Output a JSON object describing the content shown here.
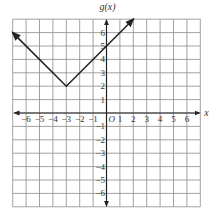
{
  "chart_data": {
    "type": "line",
    "title": "",
    "function_label": "g(x)",
    "xlabel": "x",
    "ylabel": "g(x)",
    "xlim": [
      -7,
      7
    ],
    "ylim": [
      -7,
      7
    ],
    "grid": true,
    "x_ticks": [
      -6,
      -5,
      -4,
      -3,
      -2,
      -1,
      1,
      2,
      3,
      4,
      5,
      6
    ],
    "y_ticks": [
      -6,
      -5,
      -4,
      -3,
      -2,
      -1,
      1,
      2,
      3,
      4,
      5,
      6
    ],
    "origin_label": "O",
    "series": [
      {
        "name": "g(x)",
        "description": "absolute value function g(x) = |x + 3| + 2",
        "vertex": [
          -3,
          2
        ],
        "points": [
          [
            -7,
            6
          ],
          [
            -3,
            2
          ],
          [
            2,
            7
          ]
        ],
        "arrows_at_ends": true,
        "color": "#222222"
      }
    ]
  },
  "colors": {
    "grid": "#8a8a8a",
    "axis": "#222222",
    "curve": "#222222",
    "text": "#333333"
  }
}
